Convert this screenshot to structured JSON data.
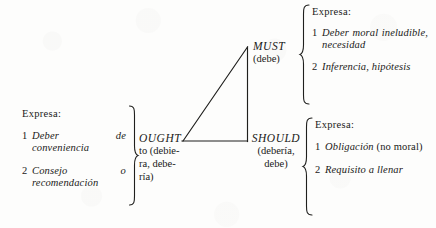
{
  "figure": {
    "type": "linguistic-diagram",
    "language": "es",
    "background_color": "#fdfdfc",
    "ink_color": "#1a1a18"
  },
  "triangle": {
    "name": "modality-triangle",
    "apex": {
      "x": 247,
      "y": 47
    },
    "base_left": {
      "x": 182,
      "y": 141
    },
    "base_right": {
      "x": 247,
      "y": 141
    }
  },
  "modals": {
    "must": {
      "word": "MUST",
      "gloss": "(debe)"
    },
    "ought": {
      "word": "OUGHT",
      "gloss_lines": [
        "to  (debie-",
        "ra,    debe-",
        "ría)"
      ]
    },
    "should": {
      "word": "SHOULD",
      "gloss_lines": [
        "(debería,",
        "debe)"
      ]
    }
  },
  "groups": {
    "left": {
      "heading": "Expresa:",
      "items": [
        {
          "num": "1",
          "text": "Deber de conveniencia"
        },
        {
          "num": "2",
          "text": "Consejo o recomendación"
        }
      ]
    },
    "top_right": {
      "heading": "Expresa:",
      "items": [
        {
          "num": "1",
          "text": "Deber moral ineludible, necesidad"
        },
        {
          "num": "2",
          "text": "Inferencia, hipótesis"
        }
      ]
    },
    "bottom_right": {
      "heading": "Expresa:",
      "items": [
        {
          "num": "1",
          "text_italic": "Obligación",
          "text_roman": " (no moral)"
        },
        {
          "num": "2",
          "text": "Requisito a llenar"
        }
      ]
    }
  }
}
